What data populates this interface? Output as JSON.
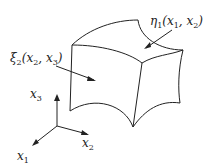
{
  "diagram": {
    "labels": {
      "eta": {
        "sym": "η",
        "sub": "1",
        "args": "(x",
        "a1": "1",
        "sep": ", x",
        "a2": "2",
        "close": ")"
      },
      "xi": {
        "sym": "ξ",
        "sub": "2",
        "args": "(x",
        "a1": "2",
        "sep": ", x",
        "a2": "3",
        "close": ")"
      },
      "x1": {
        "sym": "x",
        "sub": "1"
      },
      "x2": {
        "sym": "x",
        "sub": "2"
      },
      "x3": {
        "sym": "x",
        "sub": "3"
      }
    },
    "stroke_color": "#222222"
  }
}
